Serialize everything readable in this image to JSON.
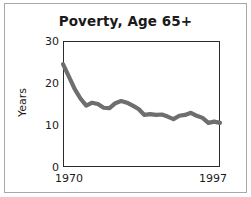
{
  "chart_data": {
    "type": "line",
    "title": "Poverty, Age 65+",
    "xlabel": "",
    "ylabel": "Years",
    "xlim": [
      1970,
      1997
    ],
    "ylim": [
      0,
      30
    ],
    "yticks": [
      0,
      10,
      20,
      30
    ],
    "ytick_labels": [
      "0",
      "10",
      "20",
      "30"
    ],
    "xticks": [
      1970,
      1997
    ],
    "xtick_labels": [
      "1970",
      "1997"
    ],
    "grid": false,
    "legend": false,
    "line_color": "#6e6e6e",
    "line_width": 4,
    "x": [
      1970,
      1971,
      1972,
      1973,
      1974,
      1975,
      1976,
      1977,
      1978,
      1979,
      1980,
      1981,
      1982,
      1983,
      1984,
      1985,
      1986,
      1987,
      1988,
      1989,
      1990,
      1991,
      1992,
      1993,
      1994,
      1995,
      1996,
      1997
    ],
    "values": [
      24.5,
      21.6,
      18.6,
      16.3,
      14.6,
      15.3,
      15.0,
      14.1,
      14.0,
      15.2,
      15.7,
      15.3,
      14.6,
      13.8,
      12.4,
      12.6,
      12.4,
      12.5,
      12.0,
      11.4,
      12.2,
      12.4,
      12.9,
      12.2,
      11.7,
      10.5,
      10.8,
      10.5
    ],
    "series": [
      {
        "name": "Poverty rate, age 65+",
        "values": [
          24.5,
          21.6,
          18.6,
          16.3,
          14.6,
          15.3,
          15.0,
          14.1,
          14.0,
          15.2,
          15.7,
          15.3,
          14.6,
          13.8,
          12.4,
          12.6,
          12.4,
          12.5,
          12.0,
          11.4,
          12.2,
          12.4,
          12.9,
          12.2,
          11.7,
          10.5,
          10.8,
          10.5
        ]
      }
    ]
  },
  "colors": {
    "line": "#6e6e6e",
    "axis": "#2b2b2b",
    "frame": "#a8a8a8",
    "text": "#1a1a1a",
    "background": "#ffffff"
  }
}
